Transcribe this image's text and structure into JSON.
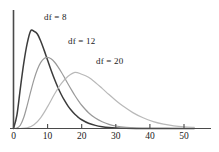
{
  "chart_data": {
    "type": "line",
    "title": "",
    "subtitle": "",
    "xlabel": "",
    "ylabel": "",
    "xlim": [
      0,
      53
    ],
    "ylim": [
      0,
      0.125
    ],
    "grid": false,
    "legend_position": "inline-annotations",
    "x_ticks": [
      "0",
      "10",
      "20",
      "30",
      "40",
      "50"
    ],
    "x_tick_values": [
      0,
      10,
      20,
      30,
      40,
      50
    ],
    "y_ticks": [],
    "annotations": [
      {
        "text": "df = 8",
        "x": 8,
        "y": 0.112
      },
      {
        "text": "df = 12",
        "x": 16,
        "y": 0.085
      },
      {
        "text": "df = 20",
        "x": 24,
        "y": 0.066
      }
    ],
    "series": [
      {
        "name": "df = 8",
        "df": 8,
        "color": "#3c3c3c",
        "peak_x": 6,
        "peak_y": 0.1116,
        "x": [
          0,
          1,
          2,
          3,
          4,
          5,
          6,
          7,
          8,
          9,
          10,
          11,
          12,
          13,
          14,
          15,
          16,
          17,
          18,
          19,
          20,
          22,
          24,
          26,
          28,
          30,
          33,
          36,
          40,
          45,
          50,
          53
        ],
        "y": [
          0.0,
          0.0153,
          0.046,
          0.075,
          0.0977,
          0.1123,
          0.112,
          0.1089,
          0.1005,
          0.09,
          0.0787,
          0.0675,
          0.0571,
          0.0476,
          0.0392,
          0.032,
          0.0258,
          0.0207,
          0.0164,
          0.0129,
          0.0101,
          0.0061,
          0.0036,
          0.0021,
          0.0012,
          0.0007,
          0.0003,
          0.0001,
          3e-05,
          1e-05,
          0.0,
          0.0
        ]
      },
      {
        "name": "df = 12",
        "df": 12,
        "color": "#9a9a9a",
        "peak_x": 10,
        "peak_y": 0.0883,
        "x": [
          0,
          1,
          2,
          3,
          4,
          5,
          6,
          7,
          8,
          9,
          10,
          11,
          12,
          13,
          14,
          15,
          16,
          17,
          18,
          19,
          20,
          22,
          24,
          26,
          28,
          30,
          33,
          36,
          40,
          45,
          50,
          53
        ],
        "y": [
          0.0,
          0.0004,
          0.0038,
          0.0126,
          0.0264,
          0.0418,
          0.0563,
          0.068,
          0.0762,
          0.0807,
          0.0819,
          0.0803,
          0.0766,
          0.0713,
          0.0651,
          0.0583,
          0.0513,
          0.0445,
          0.038,
          0.0321,
          0.0268,
          0.0182,
          0.012,
          0.0077,
          0.0048,
          0.0029,
          0.0013,
          0.0006,
          0.0002,
          3e-05,
          1e-05,
          0.0
        ]
      },
      {
        "name": "df = 20",
        "df": 20,
        "color": "#b9b9b9",
        "peak_x": 18,
        "peak_y": 0.0647,
        "x": [
          0,
          2,
          4,
          6,
          8,
          10,
          12,
          14,
          16,
          18,
          20,
          22,
          24,
          26,
          28,
          30,
          32,
          35,
          38,
          41,
          44,
          47,
          50,
          53
        ],
        "y": [
          0.0,
          2e-05,
          0.0007,
          0.0042,
          0.0126,
          0.0252,
          0.0394,
          0.0516,
          0.0601,
          0.0647,
          0.0625,
          0.059,
          0.0531,
          0.0462,
          0.0391,
          0.0323,
          0.0261,
          0.0183,
          0.0123,
          0.008,
          0.005,
          0.0031,
          0.0019,
          0.0012
        ]
      }
    ]
  },
  "axes": {
    "x_axis_name": "horizontal-axis",
    "y_axis_name": "vertical-axis"
  }
}
